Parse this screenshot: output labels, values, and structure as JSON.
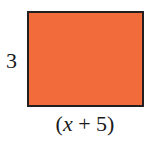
{
  "diagram": {
    "shape": "rectangle",
    "fill_color": "#f26b3a",
    "border_color": "#231f20",
    "labels": {
      "height": "3",
      "width_open": "(",
      "width_var": "x",
      "width_rest": " + 5)"
    }
  }
}
